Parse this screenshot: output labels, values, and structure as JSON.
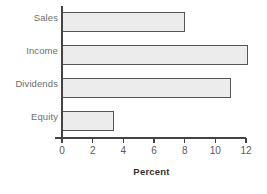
{
  "chart_data": {
    "type": "bar",
    "orientation": "horizontal",
    "title": "",
    "categories": [
      "Sales",
      "Income",
      "Dividends",
      "Equity"
    ],
    "values": [
      8.0,
      12.1,
      11.0,
      3.4
    ],
    "xlabel": "Percent",
    "ylabel": "",
    "xlim": [
      0,
      12
    ],
    "xticks": [
      0,
      2,
      4,
      6,
      8,
      10,
      12
    ],
    "xtick_labels": [
      "0",
      "2",
      "4",
      "6",
      "8",
      "10",
      "12"
    ],
    "grid": false,
    "legend": false,
    "bar_fill_color": "#ececec",
    "bar_border_color": "#555555",
    "axis_color": "#444444",
    "label_color": "#6e6e6e"
  }
}
